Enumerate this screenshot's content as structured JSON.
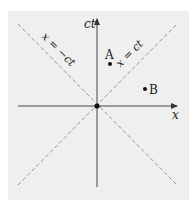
{
  "diagram": {
    "axes": {
      "horizontal": {
        "label": "x"
      },
      "vertical": {
        "label": "ct"
      }
    },
    "light_lines": [
      {
        "label": "x = ct",
        "slope": 1
      },
      {
        "label": "x = −ct",
        "slope": -1
      }
    ],
    "points": [
      {
        "name": "A",
        "label": "A"
      },
      {
        "name": "B",
        "label": "B"
      },
      {
        "name": "O",
        "label": ""
      }
    ],
    "colors": {
      "background": "#efefef",
      "axis": "#333333",
      "dashed": "#8a8a8a",
      "point": "#111111"
    }
  }
}
